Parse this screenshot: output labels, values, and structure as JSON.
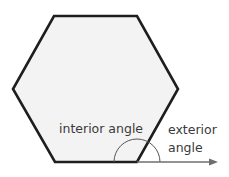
{
  "diagram": {
    "shape": "regular hexagon",
    "labels": {
      "interior": "interior angle",
      "exterior_line1": "exterior",
      "exterior_line2": "angle"
    },
    "colors": {
      "fill": "#f3f3f3",
      "outline": "#1e1e1e",
      "arc": "#555555",
      "arrow": "#6e6e6e",
      "text": "#3a3a3a"
    }
  }
}
